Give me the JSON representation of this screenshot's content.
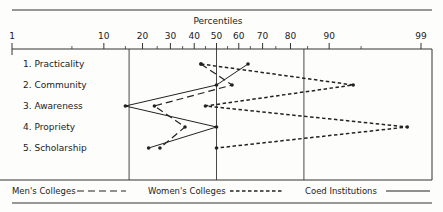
{
  "chart_data": {
    "type": "line",
    "title": "Percentiles",
    "orientation": "horizontal-profile",
    "xlabel": "Percentiles",
    "x_scale": "normal-probability",
    "xlim": [
      1,
      99
    ],
    "x_tick_labels": [
      "1",
      "10",
      "20",
      "30",
      "40",
      "50",
      "60",
      "70",
      "80",
      "90",
      "99"
    ],
    "x_ticks": [
      1,
      10,
      20,
      30,
      40,
      50,
      60,
      70,
      80,
      90,
      99
    ],
    "reference_lines": [
      16,
      50,
      84
    ],
    "categories": [
      "1. Practicality",
      "2. Community",
      "3. Awareness",
      "4. Propriety",
      "5. Scholarship"
    ],
    "series": [
      {
        "name": "Men's Colleges",
        "style": "long-dash",
        "values": [
          43,
          57,
          24,
          36,
          26
        ]
      },
      {
        "name": "Women's Colleges",
        "style": "short-dash",
        "values": [
          43,
          94,
          45,
          98.5,
          50
        ]
      },
      {
        "name": "Coed Institutions",
        "style": "solid",
        "values": [
          64,
          50,
          15,
          50,
          22
        ]
      }
    ],
    "legend": {
      "placement": "bottom",
      "entries": [
        "Men's Colleges",
        "Women's Colleges",
        "Coed Institutions"
      ]
    },
    "grid": false
  }
}
